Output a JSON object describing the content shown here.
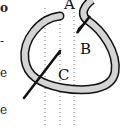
{
  "diagram": {
    "type": "embroidery-stitch-illustration",
    "labels": {
      "a": "A",
      "b": "B",
      "c": "C"
    },
    "left_margin_fragments": [
      "o",
      "-",
      "e",
      "e"
    ],
    "colors": {
      "thread_fill": "#d4d4d4",
      "outline": "#111111",
      "guide_lines": "#777777",
      "background": "#ffffff"
    }
  }
}
